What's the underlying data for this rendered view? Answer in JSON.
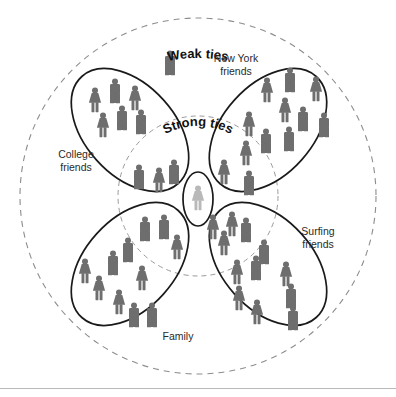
{
  "figure": {
    "type": "social-network-venn",
    "title_visible": false,
    "background": "#ffffff",
    "person_color": "#6e6e6e",
    "ego_color": "#b9b9b9",
    "cluster_stroke": "#1a1a1a",
    "ring_stroke": "#8d8d8d"
  },
  "rings": [
    {
      "id": "weak",
      "label": "Weak ties",
      "style": "dashed",
      "cx": 198,
      "cy": 196,
      "r": 178
    },
    {
      "id": "strong",
      "label": "Strong ties",
      "style": "dashed",
      "cx": 198,
      "cy": 196,
      "r": 80
    }
  ],
  "clusters": [
    {
      "id": "college-friends",
      "label": "College friends",
      "label_lines": [
        "College",
        "friends"
      ],
      "label_x": 76,
      "label_y": 158,
      "cx": 130,
      "cy": 130,
      "rx": 45,
      "ry": 72,
      "rotate": -42,
      "member_count": 7,
      "members": [
        {
          "sex": "f",
          "x": 95,
          "y": 101
        },
        {
          "sex": "m",
          "x": 114,
          "y": 93
        },
        {
          "sex": "f",
          "x": 134,
          "y": 99
        },
        {
          "sex": "f",
          "x": 104,
          "y": 125
        },
        {
          "sex": "m",
          "x": 122,
          "y": 120
        },
        {
          "sex": "m",
          "x": 140,
          "y": 122
        },
        {
          "sex": "m",
          "x": 122,
          "y": 120
        }
      ]
    },
    {
      "id": "new-york-friends",
      "label": "New York friends",
      "label_lines": [
        "New York",
        "friends"
      ],
      "label_x": 236,
      "label_y": 58,
      "cx": 268,
      "cy": 130,
      "rx": 45,
      "ry": 72,
      "rotate": 42,
      "member_count": 12,
      "members": [
        {
          "sex": "f",
          "x": 266,
          "y": 91
        },
        {
          "sex": "m",
          "x": 288,
          "y": 81
        },
        {
          "sex": "f",
          "x": 316,
          "y": 89
        },
        {
          "sex": "f",
          "x": 284,
          "y": 110
        },
        {
          "sex": "f",
          "x": 249,
          "y": 124
        },
        {
          "sex": "m",
          "x": 300,
          "y": 119
        },
        {
          "sex": "m",
          "x": 322,
          "y": 124
        },
        {
          "sex": "m",
          "x": 265,
          "y": 141
        },
        {
          "sex": "m",
          "x": 288,
          "y": 139
        },
        {
          "sex": "f",
          "x": 246,
          "y": 153
        },
        {
          "sex": "f",
          "x": 252,
          "y": 168
        },
        {
          "sex": "m",
          "x": 282,
          "y": 176
        }
      ]
    },
    {
      "id": "family",
      "label": "Family",
      "label_lines": [
        "Family"
      ],
      "label_x": 157,
      "label_y": 337,
      "cx": 130,
      "cy": 264,
      "rx": 45,
      "ry": 72,
      "rotate": 42,
      "member_count": 13,
      "members": [
        {
          "sex": "m",
          "x": 145,
          "y": 230
        },
        {
          "sex": "m",
          "x": 163,
          "y": 228
        },
        {
          "sex": "f",
          "x": 176,
          "y": 247
        },
        {
          "sex": "m",
          "x": 128,
          "y": 250
        },
        {
          "sex": "f",
          "x": 84,
          "y": 271
        },
        {
          "sex": "m",
          "x": 112,
          "y": 264
        },
        {
          "sex": "f",
          "x": 141,
          "y": 278
        },
        {
          "sex": "f",
          "x": 98,
          "y": 288
        },
        {
          "sex": "f",
          "x": 118,
          "y": 302
        },
        {
          "sex": "m",
          "x": 133,
          "y": 315
        },
        {
          "sex": "m",
          "x": 151,
          "y": 315
        },
        {
          "sex": "m",
          "x": 112,
          "y": 264
        },
        {
          "sex": "f",
          "x": 141,
          "y": 278
        }
      ]
    },
    {
      "id": "surfing-friends",
      "label": "Surfing friends",
      "label_lines": [
        "Surfing",
        "friends"
      ],
      "label_x": 296,
      "label_y": 232,
      "cx": 268,
      "cy": 264,
      "rx": 45,
      "ry": 72,
      "rotate": -42,
      "member_count": 13,
      "members": [
        {
          "sex": "f",
          "x": 213,
          "y": 228
        },
        {
          "sex": "f",
          "x": 232,
          "y": 225
        },
        {
          "sex": "f",
          "x": 224,
          "y": 243
        },
        {
          "sex": "m",
          "x": 245,
          "y": 231
        },
        {
          "sex": "m",
          "x": 263,
          "y": 252
        },
        {
          "sex": "f",
          "x": 236,
          "y": 272
        },
        {
          "sex": "m",
          "x": 255,
          "y": 268
        },
        {
          "sex": "f",
          "x": 285,
          "y": 274
        },
        {
          "sex": "f",
          "x": 238,
          "y": 298
        },
        {
          "sex": "m",
          "x": 290,
          "y": 296
        },
        {
          "sex": "f",
          "x": 256,
          "y": 312
        },
        {
          "sex": "m",
          "x": 292,
          "y": 318
        },
        {
          "sex": "m",
          "x": 263,
          "y": 252
        }
      ]
    }
  ],
  "inner_members": [
    {
      "sex": "m",
      "x": 138,
      "y": 177
    },
    {
      "sex": "f",
      "x": 158,
      "y": 180
    },
    {
      "sex": "m",
      "x": 173,
      "y": 172
    },
    {
      "sex": "f",
      "x": 224,
      "y": 172
    },
    {
      "sex": "m",
      "x": 248,
      "y": 183
    }
  ],
  "outlier_members": [
    {
      "sex": "m",
      "x": 170,
      "y": 63,
      "note": "isolated weak tie near top"
    }
  ],
  "ego": {
    "id": "ego-self",
    "sex": "f",
    "x": 198,
    "y": 196,
    "ellipse": {
      "cx": 198,
      "cy": 199,
      "rx": 15,
      "ry": 27
    },
    "highlight": true
  },
  "counts": {
    "total_people": 51,
    "clusters": 4,
    "rings": 2
  }
}
